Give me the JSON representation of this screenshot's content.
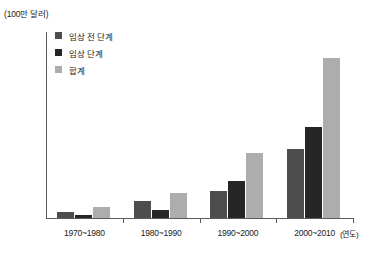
{
  "chart_data": {
    "type": "bar",
    "title": "",
    "subtitle": "",
    "unit_label": "(100만 달러)",
    "xlabel": "(연도)",
    "ylabel": "",
    "categories": [
      "1970~1980",
      "1980~1990",
      "1990~2000",
      "2000~2010"
    ],
    "series": [
      {
        "name": "임상 전 단계",
        "color": "#4d4d4d",
        "values": [
          100,
          270,
          430,
          1110
        ]
      },
      {
        "name": "임상 단계",
        "color": "#262626",
        "values": [
          55,
          130,
          600,
          1460
        ]
      },
      {
        "name": "합계",
        "color": "#adadad",
        "values": [
          175,
          410,
          1050,
          2580
        ]
      }
    ],
    "ylim": [
      0,
      3000
    ],
    "yticks": [
      0,
      500,
      1000,
      1500,
      2000,
      2500,
      3000
    ],
    "ytick_labels": [
      "0",
      "500",
      "1,000",
      "1,500",
      "2,000",
      "2,500",
      "3,000"
    ],
    "grid": false,
    "legend_position": "top-left"
  },
  "axis": {
    "y_axis_color": "#5a5a5a",
    "x_axis_color": "#5a5a5a"
  }
}
